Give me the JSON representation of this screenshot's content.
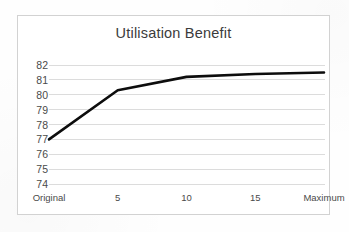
{
  "chart_data": {
    "type": "line",
    "title": "Utilisation Benefit",
    "xlabel": "",
    "ylabel": "",
    "categories": [
      "Original",
      "5",
      "10",
      "15",
      "Maximum"
    ],
    "values": [
      77.0,
      80.3,
      81.2,
      81.4,
      81.5
    ],
    "series": [
      {
        "name": "Utilisation Benefit",
        "values": [
          77.0,
          80.3,
          81.2,
          81.4,
          81.5
        ]
      }
    ],
    "ylim": [
      74,
      82
    ],
    "yticks": [
      74,
      75,
      76,
      77,
      78,
      79,
      80,
      81,
      82
    ],
    "ytick_labels": [
      "74",
      "75",
      "76",
      "77",
      "78",
      "79",
      "80",
      "81",
      "82"
    ],
    "grid": true,
    "grid_axis": "y",
    "legend": false,
    "markers": false,
    "line_color": "#0d0d0d",
    "grid_color": "#dcdcdc",
    "axis_label_color": "#4a4a4a",
    "title_color": "#3b3b3b",
    "border_color": "#d2d2d2",
    "background_color": "#ffffff"
  }
}
